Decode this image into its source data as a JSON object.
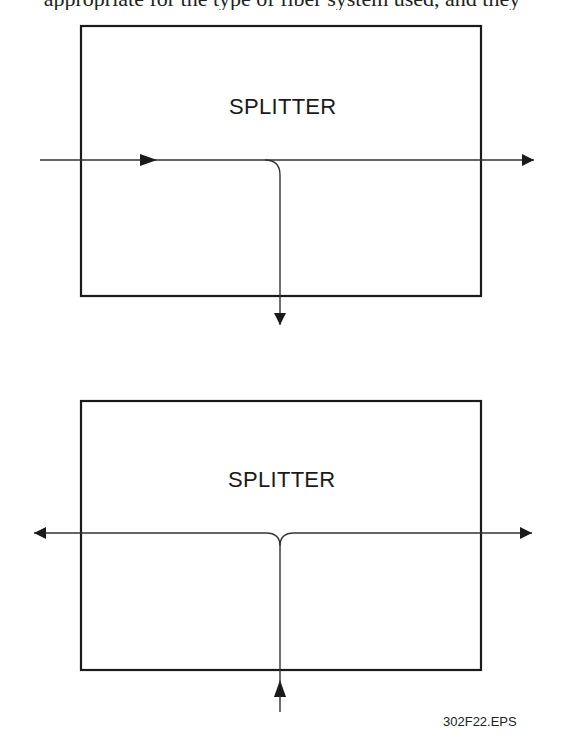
{
  "caption_clipped": "appropriate for the type of fiber system used, and they",
  "diagrams": [
    {
      "name": "splitter-one-input",
      "label": "SPLITTER",
      "box": {
        "x": 81,
        "y": 26,
        "w": 400,
        "h": 270
      },
      "description": "One input from left, split to output right and output down"
    },
    {
      "name": "splitter-bidirectional",
      "label": "SPLITTER",
      "box": {
        "x": 81,
        "y": 401,
        "w": 400,
        "h": 269
      },
      "description": "Input from below, split to outputs left and right"
    }
  ],
  "file_label": "302F22.EPS",
  "colors": {
    "line": "#1a1a1a",
    "background": "#ffffff"
  }
}
